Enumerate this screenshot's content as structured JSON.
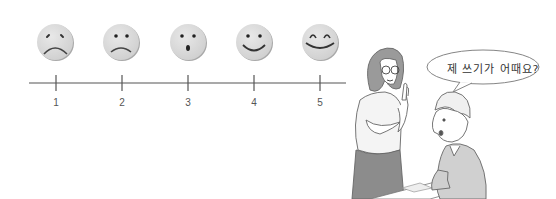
{
  "rating_scale": {
    "faces": [
      {
        "value": "1",
        "expression": "very-sad",
        "icon": "very-sad-face-icon"
      },
      {
        "value": "2",
        "expression": "sad",
        "icon": "sad-face-icon"
      },
      {
        "value": "3",
        "expression": "surprised",
        "icon": "surprised-face-icon"
      },
      {
        "value": "4",
        "expression": "happy",
        "icon": "happy-face-icon"
      },
      {
        "value": "5",
        "expression": "very-happy",
        "icon": "very-happy-face-icon"
      }
    ],
    "labels": [
      "1",
      "2",
      "3",
      "4",
      "5"
    ],
    "colors": {
      "face_fill": "#d9d9d9",
      "face_shadow": "#9a9a9a",
      "line": "#555555"
    }
  },
  "illustration": {
    "speech_bubble": {
      "text": "제 쓰기가 어때요?"
    },
    "characters": [
      "teacher-woman-with-glasses",
      "student-man-seated"
    ]
  }
}
